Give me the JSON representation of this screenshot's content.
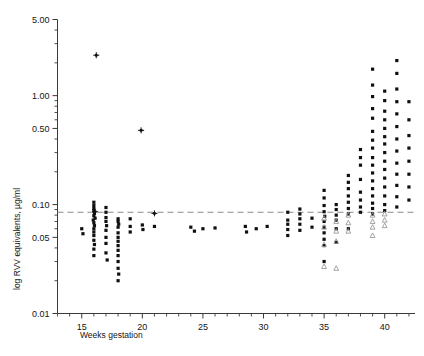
{
  "chart_data": {
    "type": "scatter",
    "title": "",
    "xlabel": "Weeks gestation",
    "ylabel": "log RVV equivalents, µg/ml",
    "xlim": [
      13.0,
      42.5
    ],
    "ylim": [
      0.01,
      5.0
    ],
    "yscale": "log",
    "grid": false,
    "legend": "none",
    "xticks": [
      15,
      20,
      25,
      30,
      35,
      40
    ],
    "xticklabels": [
      "15",
      "20",
      "25",
      "30",
      "35",
      "40"
    ],
    "yticks": [
      5.0,
      1.0,
      0.5,
      0.1,
      0.05,
      0.01
    ],
    "yticklabels": [
      "5.00",
      "1.00",
      "0.50",
      "0.10",
      "0.05",
      "0.01"
    ],
    "y_minor_ticks": [
      4.0,
      3.0,
      2.0,
      0.9,
      0.8,
      0.7,
      0.6,
      0.4,
      0.3,
      0.2,
      0.09,
      0.08,
      0.07,
      0.06,
      0.04,
      0.03,
      0.02
    ],
    "annotations": [
      {
        "type": "reference-line",
        "orientation": "horizontal",
        "value": 0.085,
        "style": "dashed",
        "color": "#8a8a8a"
      }
    ],
    "series": [
      {
        "name": "filled-circle",
        "marker": "circle-filled",
        "color": "#101010",
        "points": [
          [
            15.0,
            0.06
          ],
          [
            15.1,
            0.054
          ],
          [
            16.0,
            0.105
          ],
          [
            16.0,
            0.098
          ],
          [
            16.0,
            0.092
          ],
          [
            16.0,
            0.088
          ],
          [
            16.05,
            0.083
          ],
          [
            16.0,
            0.079
          ],
          [
            16.1,
            0.075
          ],
          [
            15.95,
            0.072
          ],
          [
            16.0,
            0.068
          ],
          [
            16.05,
            0.064
          ],
          [
            16.0,
            0.06
          ],
          [
            16.0,
            0.056
          ],
          [
            16.0,
            0.052
          ],
          [
            16.0,
            0.047
          ],
          [
            16.05,
            0.043
          ],
          [
            16.0,
            0.039
          ],
          [
            16.0,
            0.034
          ],
          [
            17.0,
            0.094
          ],
          [
            17.0,
            0.085
          ],
          [
            17.0,
            0.076
          ],
          [
            17.0,
            0.07
          ],
          [
            17.05,
            0.064
          ],
          [
            17.0,
            0.058
          ],
          [
            17.0,
            0.05
          ],
          [
            17.0,
            0.044
          ],
          [
            17.0,
            0.036
          ],
          [
            17.1,
            0.031
          ],
          [
            18.0,
            0.074
          ],
          [
            18.0,
            0.07
          ],
          [
            18.05,
            0.066
          ],
          [
            18.0,
            0.062
          ],
          [
            18.0,
            0.055
          ],
          [
            18.0,
            0.05
          ],
          [
            18.0,
            0.046
          ],
          [
            18.0,
            0.042
          ],
          [
            18.0,
            0.038
          ],
          [
            18.0,
            0.034
          ],
          [
            18.0,
            0.03
          ],
          [
            18.0,
            0.026
          ],
          [
            18.05,
            0.023
          ],
          [
            18.0,
            0.02
          ],
          [
            19.0,
            0.074
          ],
          [
            19.0,
            0.063
          ],
          [
            19.0,
            0.056
          ],
          [
            20.0,
            0.065
          ],
          [
            20.05,
            0.059
          ],
          [
            21.0,
            0.063
          ],
          [
            24.0,
            0.062
          ],
          [
            24.3,
            0.057
          ],
          [
            25.0,
            0.06
          ],
          [
            26.0,
            0.061
          ],
          [
            28.5,
            0.063
          ],
          [
            28.6,
            0.056
          ],
          [
            29.4,
            0.06
          ],
          [
            30.3,
            0.063
          ],
          [
            32.0,
            0.085
          ],
          [
            32.0,
            0.072
          ],
          [
            32.0,
            0.066
          ],
          [
            32.0,
            0.059
          ],
          [
            32.0,
            0.052
          ],
          [
            33.0,
            0.091
          ],
          [
            33.0,
            0.082
          ],
          [
            33.0,
            0.074
          ],
          [
            33.0,
            0.066
          ],
          [
            33.0,
            0.058
          ],
          [
            34.0,
            0.075
          ],
          [
            34.0,
            0.062
          ],
          [
            35.0,
            0.135
          ],
          [
            35.0,
            0.115
          ],
          [
            35.0,
            0.098
          ],
          [
            35.0,
            0.086
          ],
          [
            35.05,
            0.078
          ],
          [
            35.0,
            0.07
          ],
          [
            35.0,
            0.062
          ],
          [
            35.0,
            0.055
          ],
          [
            35.0,
            0.048
          ],
          [
            35.0,
            0.042
          ],
          [
            35.0,
            0.03
          ],
          [
            36.0,
            0.1
          ],
          [
            36.0,
            0.09
          ],
          [
            36.0,
            0.08
          ],
          [
            36.0,
            0.072
          ],
          [
            36.0,
            0.06
          ],
          [
            36.0,
            0.045
          ],
          [
            37.0,
            0.185
          ],
          [
            37.0,
            0.16
          ],
          [
            37.0,
            0.14
          ],
          [
            37.0,
            0.12
          ],
          [
            37.0,
            0.105
          ],
          [
            37.0,
            0.092
          ],
          [
            37.0,
            0.082
          ],
          [
            37.0,
            0.06
          ],
          [
            38.0,
            0.32
          ],
          [
            38.0,
            0.27
          ],
          [
            38.0,
            0.23
          ],
          [
            38.0,
            0.17
          ],
          [
            38.0,
            0.13
          ],
          [
            38.0,
            0.11
          ],
          [
            38.0,
            0.095
          ],
          [
            38.0,
            0.085
          ],
          [
            39.0,
            1.75
          ],
          [
            39.0,
            1.25
          ],
          [
            39.0,
            0.98
          ],
          [
            39.0,
            0.76
          ],
          [
            39.0,
            0.62
          ],
          [
            39.0,
            0.47
          ],
          [
            39.0,
            0.39
          ],
          [
            39.0,
            0.33
          ],
          [
            39.0,
            0.27
          ],
          [
            39.0,
            0.23
          ],
          [
            39.0,
            0.195
          ],
          [
            39.0,
            0.165
          ],
          [
            39.0,
            0.14
          ],
          [
            39.0,
            0.12
          ],
          [
            39.0,
            0.103
          ],
          [
            39.0,
            0.092
          ],
          [
            39.0,
            0.082
          ],
          [
            40.0,
            1.1
          ],
          [
            40.0,
            0.9
          ],
          [
            40.0,
            0.72
          ],
          [
            40.0,
            0.6
          ],
          [
            40.0,
            0.5
          ],
          [
            40.0,
            0.42
          ],
          [
            40.0,
            0.36
          ],
          [
            40.0,
            0.3
          ],
          [
            40.0,
            0.25
          ],
          [
            40.0,
            0.21
          ],
          [
            40.0,
            0.175
          ],
          [
            40.0,
            0.145
          ],
          [
            40.0,
            0.12
          ],
          [
            40.0,
            0.1
          ],
          [
            40.0,
            0.088
          ],
          [
            41.0,
            2.1
          ],
          [
            41.0,
            1.6
          ],
          [
            41.0,
            1.15
          ],
          [
            41.0,
            0.88
          ],
          [
            41.0,
            0.68
          ],
          [
            41.0,
            0.52
          ],
          [
            41.0,
            0.4
          ],
          [
            41.0,
            0.31
          ],
          [
            41.0,
            0.24
          ],
          [
            41.0,
            0.19
          ],
          [
            41.0,
            0.15
          ],
          [
            41.0,
            0.118
          ],
          [
            41.0,
            0.095
          ],
          [
            42.0,
            0.88
          ],
          [
            42.0,
            0.6
          ],
          [
            42.0,
            0.43
          ],
          [
            42.0,
            0.33
          ],
          [
            42.0,
            0.25
          ],
          [
            42.0,
            0.19
          ],
          [
            42.0,
            0.145
          ],
          [
            42.0,
            0.11
          ]
        ]
      },
      {
        "name": "open-triangle",
        "marker": "triangle-open",
        "color": "#9a9a9a",
        "points": [
          [
            35.0,
            0.075
          ],
          [
            35.0,
            0.062
          ],
          [
            35.0,
            0.043
          ],
          [
            35.0,
            0.027
          ],
          [
            36.0,
            0.07
          ],
          [
            36.0,
            0.057
          ],
          [
            36.0,
            0.046
          ],
          [
            36.0,
            0.026
          ],
          [
            37.0,
            0.08
          ],
          [
            37.0,
            0.068
          ],
          [
            37.0,
            0.057
          ],
          [
            39.0,
            0.08
          ],
          [
            39.0,
            0.07
          ],
          [
            39.0,
            0.062
          ],
          [
            39.0,
            0.052
          ],
          [
            40.0,
            0.082
          ],
          [
            40.0,
            0.072
          ],
          [
            40.0,
            0.064
          ]
        ]
      },
      {
        "name": "cross-marker",
        "marker": "cross",
        "color": "#101010",
        "points": [
          [
            16.2,
            2.35
          ],
          [
            19.9,
            0.48
          ],
          [
            16.1,
            0.086
          ],
          [
            21.0,
            0.083
          ]
        ]
      }
    ]
  },
  "axes": {
    "x_axis_title": "Weeks gestation",
    "y_axis_title": "log RVV equivalents, µg/ml"
  }
}
